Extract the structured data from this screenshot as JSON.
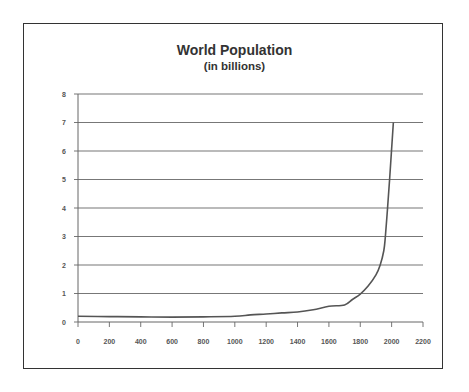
{
  "chart_data": {
    "type": "line",
    "title": "World Population",
    "subtitle": "(in billions)",
    "xlabel": "",
    "ylabel": "",
    "xlim": [
      0,
      2200
    ],
    "ylim": [
      0,
      8
    ],
    "x_ticks": [
      0,
      200,
      400,
      600,
      800,
      1000,
      1200,
      1400,
      1600,
      1800,
      2000,
      2200
    ],
    "y_ticks": [
      0,
      1,
      2,
      3,
      4,
      5,
      6,
      7,
      8
    ],
    "grid": "horizontal",
    "legend": null,
    "series": [
      {
        "name": "World Population",
        "color": "#555555",
        "x": [
          0,
          200,
          400,
          600,
          800,
          1000,
          1100,
          1200,
          1300,
          1400,
          1500,
          1600,
          1700,
          1750,
          1800,
          1850,
          1900,
          1927,
          1950,
          1960,
          1974,
          1987,
          1999,
          2011
        ],
        "y": [
          0.2,
          0.19,
          0.18,
          0.17,
          0.18,
          0.2,
          0.25,
          0.28,
          0.32,
          0.35,
          0.43,
          0.55,
          0.6,
          0.79,
          0.98,
          1.26,
          1.65,
          2.0,
          2.5,
          3.0,
          4.0,
          5.0,
          6.0,
          7.0
        ]
      }
    ]
  }
}
